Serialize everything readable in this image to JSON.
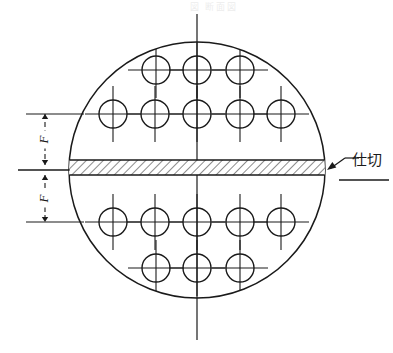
{
  "drawing": {
    "type": "engineering-drawing",
    "description": "Tubesheet layout with circular shell, tube holes and a hatched horizontal partition plate",
    "background_color": "#ffffff",
    "line_color": "#1a1a1a",
    "shell": {
      "center_x": 197,
      "center_y": 170,
      "radius": 128,
      "stroke_width": 1.5
    },
    "centerlines": {
      "vertical": {
        "x": 197,
        "y1": 14,
        "y2": 340
      },
      "horizontal_left_stub": {
        "y": 170,
        "x1": 18,
        "x2": 70
      },
      "stroke_width": 1.2
    },
    "partition": {
      "label": "仕切",
      "label_x": 352,
      "label_y": 160,
      "y_top": 160,
      "y_bottom": 175,
      "x_left": 69,
      "x_right": 325,
      "hatch_angle_deg": 45,
      "hatch_spacing": 6,
      "leader": {
        "arrow_x": 327,
        "arrow_y": 170,
        "elbow_x": 345,
        "elbow_y": 158
      },
      "underline": {
        "x1": 339,
        "y1": 180,
        "x2": 389,
        "y2": 180
      }
    },
    "dimensions": {
      "upper": {
        "label": "F",
        "x": 45,
        "y_top": 114,
        "y_bottom": 165
      },
      "lower": {
        "label": "F",
        "x": 45,
        "y_top": 175,
        "y_bottom": 222
      },
      "extension_lines": [
        {
          "y": 114,
          "x1": 26,
          "x2": 84
        },
        {
          "y": 170,
          "x1": 18,
          "x2": 70
        },
        {
          "y": 222,
          "x1": 26,
          "x2": 84
        }
      ]
    },
    "tubes": {
      "radius": 14,
      "crosshair_overhang": 14,
      "rows": [
        {
          "name": "row-1",
          "y": 70,
          "x": [
            156,
            197,
            240
          ]
        },
        {
          "name": "row-2",
          "y": 114,
          "x": [
            113,
            155,
            197,
            240,
            281
          ]
        },
        {
          "name": "row-3",
          "y": 222,
          "x": [
            113,
            155,
            197,
            240,
            281
          ]
        },
        {
          "name": "row-4",
          "y": 268,
          "x": [
            156,
            197,
            240
          ]
        }
      ],
      "total_count": 16
    },
    "top_fragment_text": "図 断面図"
  }
}
